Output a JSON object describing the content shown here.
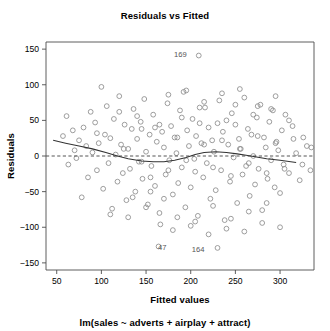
{
  "chart_data": {
    "type": "scatter",
    "title": "Residuals vs Fitted",
    "subtitle": "lm(sales ~ adverts + airplay + attract)",
    "xlabel": "Fitted values",
    "ylabel": "Residuals",
    "xlim": [
      38,
      338
    ],
    "ylim": [
      -160,
      160
    ],
    "xticks": [
      50,
      100,
      150,
      200,
      250,
      300
    ],
    "yticks": [
      150,
      100,
      50,
      0,
      -50,
      -100,
      -150
    ],
    "grid": false,
    "legend": null,
    "reference_line": {
      "y": 0,
      "style": "dashed",
      "color": "#555555"
    },
    "smoother": {
      "name": "loess",
      "style": "solid",
      "color": "#333333",
      "points": [
        [
          46,
          22
        ],
        [
          60,
          18
        ],
        [
          75,
          14
        ],
        [
          90,
          10
        ],
        [
          105,
          5
        ],
        [
          118,
          0
        ],
        [
          130,
          -4
        ],
        [
          145,
          -7
        ],
        [
          158,
          -8
        ],
        [
          170,
          -8
        ],
        [
          182,
          -6
        ],
        [
          195,
          -2
        ],
        [
          205,
          2
        ],
        [
          215,
          5
        ],
        [
          228,
          6
        ],
        [
          240,
          5
        ],
        [
          252,
          3
        ],
        [
          262,
          1
        ],
        [
          272,
          -1
        ],
        [
          285,
          -4
        ],
        [
          300,
          -6
        ],
        [
          318,
          -9
        ]
      ]
    },
    "annotations": [
      {
        "label": "169",
        "x": 209,
        "y": 141,
        "label_dx": -12,
        "label_dy": 1
      },
      {
        "label": "47",
        "x": 164,
        "y": -127,
        "label_dx": 8,
        "label_dy": 4
      },
      {
        "label": "164",
        "x": 230,
        "y": -129,
        "label_dx": -13,
        "label_dy": 4
      }
    ],
    "x": [
      209,
      164,
      230,
      57,
      61,
      63,
      68,
      70,
      72,
      75,
      78,
      80,
      83,
      85,
      88,
      90,
      93,
      95,
      97,
      100,
      102,
      104,
      106,
      108,
      110,
      112,
      114,
      116,
      118,
      120,
      122,
      124,
      126,
      128,
      130,
      132,
      134,
      136,
      138,
      140,
      142,
      144,
      146,
      148,
      150,
      152,
      154,
      156,
      158,
      160,
      162,
      166,
      168,
      170,
      172,
      174,
      176,
      178,
      180,
      182,
      184,
      186,
      188,
      190,
      192,
      194,
      196,
      198,
      200,
      202,
      204,
      206,
      208,
      210,
      212,
      214,
      216,
      218,
      220,
      222,
      224,
      226,
      228,
      232,
      234,
      236,
      238,
      240,
      242,
      244,
      246,
      248,
      250,
      252,
      254,
      256,
      258,
      260,
      262,
      264,
      266,
      268,
      270,
      272,
      274,
      276,
      278,
      280,
      282,
      284,
      286,
      288,
      290,
      292,
      294,
      296,
      298,
      300,
      302,
      304,
      306,
      310,
      314,
      318,
      322,
      326,
      330,
      334,
      95,
      125,
      145,
      165,
      185,
      205,
      225,
      245,
      265,
      285,
      110,
      135,
      155,
      175,
      195,
      215,
      235,
      255,
      275,
      295,
      120,
      140,
      160,
      180,
      200,
      220,
      240,
      260,
      280,
      300,
      130,
      150,
      170,
      190,
      210,
      230,
      250,
      270,
      290,
      310,
      145,
      165,
      185,
      205,
      225,
      245,
      265,
      285,
      305,
      325,
      155,
      175,
      195,
      215,
      235,
      255,
      275,
      295,
      315,
      335
    ],
    "y": [
      141,
      -127,
      -129,
      28,
      56,
      -12,
      36,
      8,
      -3,
      22,
      -58,
      40,
      14,
      -30,
      62,
      5,
      47,
      -20,
      18,
      97,
      -46,
      30,
      70,
      -10,
      25,
      -74,
      52,
      2,
      -36,
      84,
      16,
      -24,
      44,
      -62,
      10,
      -18,
      38,
      66,
      -50,
      24,
      -8,
      48,
      -32,
      80,
      6,
      -68,
      30,
      -14,
      58,
      -42,
      20,
      -96,
      34,
      12,
      -26,
      74,
      -6,
      42,
      -54,
      26,
      4,
      -38,
      64,
      -16,
      90,
      -72,
      36,
      14,
      -44,
      52,
      -4,
      28,
      -84,
      46,
      18,
      -30,
      68,
      -10,
      40,
      -60,
      22,
      6,
      -48,
      78,
      -20,
      34,
      -90,
      50,
      16,
      -36,
      60,
      -2,
      44,
      -66,
      24,
      10,
      -26,
      82,
      -14,
      38,
      -56,
      30,
      0,
      -40,
      54,
      -18,
      72,
      -76,
      26,
      12,
      -32,
      48,
      -6,
      64,
      -44,
      20,
      8,
      -52,
      36,
      -12,
      58,
      -24,
      42,
      4,
      -34,
      26,
      14,
      -20,
      32,
      10,
      -8,
      -80,
      -86,
      -92,
      -70,
      -88,
      -78,
      -66,
      -82,
      -58,
      -50,
      86,
      92,
      76,
      88,
      94,
      70,
      84,
      62,
      56,
      40,
      -104,
      -98,
      -110,
      -102,
      -106,
      -94,
      -100,
      -86,
      -72,
      -60,
      54,
      68,
      46,
      72,
      58,
      66,
      50,
      38,
      44,
      26,
      -22,
      -16,
      -28,
      -10,
      -24,
      -18,
      -12,
      -30,
      -20,
      -6,
      16,
      22,
      10,
      28,
      18,
      24,
      12,
      20,
      8,
      14
    ]
  },
  "plot": {
    "frame": {
      "left": 46,
      "top": 42,
      "right": 314,
      "bottom": 270
    }
  }
}
